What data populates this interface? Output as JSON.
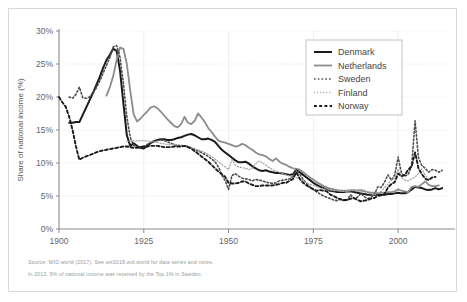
{
  "figure": {
    "notes": [
      "Source: WID.world (2017). See wir2018.wid.world for data series and notes.",
      "In 2013, 9% of national income was received by the Top 1% in Sweden."
    ]
  },
  "chart_data": {
    "type": "line",
    "title": "",
    "xlabel": "",
    "ylabel": "Share of national income (%)",
    "xlim": [
      1900,
      2015
    ],
    "ylim": [
      0,
      30
    ],
    "xticks": [
      1900,
      1925,
      1950,
      1975,
      2000
    ],
    "xtick_labels": [
      "1900",
      "1925",
      "1950",
      "1975",
      "2000"
    ],
    "yticks": [
      0,
      5,
      10,
      15,
      20,
      25,
      30
    ],
    "ytick_labels": [
      "0%",
      "5%",
      "10%",
      "15%",
      "20%",
      "25%",
      "30%"
    ],
    "grid": "horizontal-dotted-and-vertical-solid",
    "legend_position": "top-right",
    "series": [
      {
        "name": "Denmark",
        "color": "#1a1a1a",
        "style": "solid",
        "width": 2.0,
        "x": [
          1903,
          1904,
          1905,
          1906,
          1907,
          1908,
          1909,
          1910,
          1911,
          1912,
          1913,
          1914,
          1915,
          1916,
          1917,
          1918,
          1919,
          1920,
          1921,
          1922,
          1923,
          1924,
          1925,
          1926,
          1927,
          1928,
          1929,
          1930,
          1931,
          1932,
          1933,
          1934,
          1935,
          1936,
          1937,
          1938,
          1939,
          1940,
          1941,
          1942,
          1943,
          1944,
          1945,
          1946,
          1947,
          1948,
          1949,
          1950,
          1951,
          1952,
          1953,
          1954,
          1955,
          1956,
          1957,
          1958,
          1959,
          1960,
          1961,
          1962,
          1963,
          1964,
          1965,
          1966,
          1967,
          1968,
          1969,
          1970,
          1971,
          1972,
          1973,
          1974,
          1975,
          1976,
          1977,
          1978,
          1979,
          1980,
          1981,
          1982,
          1983,
          1984,
          1985,
          1986,
          1987,
          1988,
          1989,
          1990,
          1991,
          1992,
          1993,
          1994,
          1995,
          1996,
          1997,
          1998,
          1999,
          2000,
          2001,
          2002,
          2003,
          2004,
          2005,
          2006,
          2007,
          2008,
          2009,
          2010,
          2011,
          2012,
          2013
        ],
        "y": [
          16.1,
          16.1,
          16.2,
          16.2,
          17.3,
          18.4,
          19.5,
          20.6,
          21.8,
          23.0,
          24.4,
          25.6,
          26.4,
          27.3,
          27.0,
          24.0,
          19.0,
          14.2,
          12.6,
          13.0,
          12.6,
          12.3,
          12.2,
          12.6,
          13.0,
          13.3,
          13.5,
          13.6,
          13.6,
          13.5,
          13.5,
          13.6,
          13.8,
          13.9,
          14.1,
          14.3,
          14.4,
          14.2,
          13.9,
          13.6,
          13.6,
          13.7,
          13.5,
          13.2,
          12.6,
          12.0,
          11.6,
          11.2,
          10.8,
          10.4,
          10.1,
          10.1,
          10.2,
          9.9,
          9.5,
          9.2,
          8.9,
          8.8,
          8.9,
          8.7,
          8.6,
          8.5,
          8.5,
          8.4,
          8.3,
          8.2,
          8.3,
          9.0,
          8.6,
          8.2,
          7.8,
          7.4,
          7.0,
          6.7,
          6.4,
          6.2,
          6.0,
          5.8,
          5.7,
          5.6,
          5.6,
          5.6,
          5.7,
          5.7,
          5.6,
          5.5,
          5.4,
          5.3,
          5.2,
          5.2,
          5.2,
          5.2,
          5.2,
          5.2,
          5.3,
          5.3,
          5.4,
          5.5,
          5.4,
          5.4,
          5.6,
          6.0,
          6.4,
          6.3,
          6.2,
          6.0,
          5.9,
          6.0,
          6.2,
          6.0,
          6.2
        ]
      },
      {
        "name": "Netherlands",
        "color": "#8c8c8c",
        "style": "solid",
        "width": 1.8,
        "x": [
          1914,
          1915,
          1916,
          1917,
          1918,
          1919,
          1920,
          1921,
          1922,
          1923,
          1924,
          1925,
          1926,
          1927,
          1928,
          1929,
          1930,
          1931,
          1932,
          1933,
          1934,
          1935,
          1936,
          1937,
          1938,
          1939,
          1940,
          1941,
          1942,
          1943,
          1944,
          1945,
          1946,
          1947,
          1948,
          1949,
          1950,
          1951,
          1952,
          1953,
          1954,
          1955,
          1956,
          1957,
          1958,
          1959,
          1960,
          1961,
          1962,
          1963,
          1964,
          1965,
          1966,
          1967,
          1968,
          1969,
          1970,
          1971,
          1972,
          1973,
          1974,
          1975,
          1976,
          1977,
          1978,
          1979,
          1980,
          1981,
          1982,
          1983,
          1984,
          1985,
          1986,
          1987,
          1988,
          1989,
          1990,
          1991,
          1992,
          1993,
          1994,
          1995,
          1996,
          1997,
          1998,
          1999,
          2000,
          2001,
          2002,
          2003,
          2004,
          2005,
          2006,
          2007,
          2008,
          2009,
          2010,
          2011,
          2012
        ],
        "y": [
          20.2,
          21.5,
          23.2,
          25.6,
          27.5,
          27.3,
          25.0,
          21.0,
          17.4,
          16.3,
          16.7,
          17.3,
          17.8,
          18.4,
          18.6,
          18.3,
          17.8,
          17.2,
          16.6,
          16.1,
          15.6,
          15.4,
          15.9,
          17.0,
          16.1,
          15.9,
          16.4,
          17.5,
          16.9,
          16.2,
          15.3,
          14.7,
          14.0,
          13.4,
          13.2,
          13.1,
          12.9,
          12.7,
          12.5,
          12.6,
          12.9,
          12.7,
          12.3,
          12.0,
          11.6,
          11.3,
          11.2,
          11.0,
          10.6,
          10.3,
          10.7,
          10.2,
          9.9,
          9.7,
          9.4,
          9.2,
          9.1,
          9.0,
          8.6,
          8.2,
          7.8,
          7.5,
          7.1,
          6.8,
          6.5,
          6.3,
          6.1,
          6.0,
          5.9,
          5.8,
          5.8,
          5.8,
          5.9,
          5.9,
          5.8,
          5.8,
          5.7,
          5.6,
          5.5,
          5.5,
          5.4,
          5.5,
          5.5,
          5.6,
          5.6,
          5.7,
          6.0,
          5.8,
          5.7,
          5.6,
          6.4,
          6.5,
          6.4,
          6.8,
          7.2,
          6.7,
          6.5,
          6.5,
          6.6
        ]
      },
      {
        "name": "Sweden",
        "color": "#4d4d4d",
        "style": "dotted-medium",
        "width": 1.6,
        "x": [
          1903,
          1904,
          1905,
          1906,
          1907,
          1908,
          1909,
          1910,
          1911,
          1912,
          1913,
          1914,
          1915,
          1916,
          1917,
          1918,
          1919,
          1920,
          1921,
          1922,
          1923,
          1924,
          1925,
          1926,
          1927,
          1928,
          1929,
          1930,
          1931,
          1932,
          1933,
          1934,
          1935,
          1936,
          1937,
          1938,
          1939,
          1940,
          1941,
          1942,
          1943,
          1944,
          1945,
          1946,
          1947,
          1948,
          1949,
          1950,
          1951,
          1952,
          1953,
          1954,
          1955,
          1956,
          1957,
          1958,
          1959,
          1960,
          1961,
          1962,
          1963,
          1964,
          1965,
          1966,
          1967,
          1968,
          1969,
          1970,
          1971,
          1972,
          1973,
          1974,
          1975,
          1976,
          1977,
          1978,
          1979,
          1980,
          1981,
          1982,
          1983,
          1984,
          1985,
          1986,
          1987,
          1988,
          1989,
          1990,
          1991,
          1992,
          1993,
          1994,
          1995,
          1996,
          1997,
          1998,
          1999,
          2000,
          2001,
          2002,
          2003,
          2004,
          2005,
          2006,
          2007,
          2008,
          2009,
          2010,
          2011,
          2012,
          2013
        ],
        "y": [
          20.0,
          19.8,
          20.4,
          21.5,
          19.9,
          19.8,
          20.0,
          20.6,
          21.4,
          22.4,
          23.6,
          24.8,
          26.0,
          27.6,
          27.8,
          26.0,
          22.0,
          17.0,
          13.9,
          12.7,
          12.4,
          12.3,
          12.5,
          12.8,
          13.1,
          13.3,
          13.4,
          13.5,
          13.4,
          13.2,
          13.0,
          12.8,
          12.6,
          12.5,
          12.6,
          12.5,
          12.3,
          12.1,
          11.8,
          11.6,
          11.3,
          11.0,
          10.6,
          10.2,
          9.4,
          8.2,
          7.3,
          6.0,
          8.1,
          8.4,
          8.0,
          7.7,
          7.6,
          7.5,
          7.3,
          7.5,
          7.4,
          7.3,
          7.1,
          7.0,
          6.9,
          7.0,
          7.3,
          7.4,
          7.5,
          7.6,
          8.0,
          9.0,
          8.3,
          7.5,
          6.9,
          6.4,
          6.0,
          5.6,
          5.3,
          5.0,
          4.8,
          4.6,
          4.4,
          4.3,
          4.5,
          4.3,
          4.4,
          5.2,
          4.6,
          4.8,
          5.4,
          4.9,
          4.6,
          4.8,
          5.2,
          6.4,
          6.3,
          7.1,
          8.2,
          7.4,
          8.2,
          10.9,
          8.4,
          8.0,
          8.3,
          9.6,
          16.4,
          10.8,
          9.6,
          9.2,
          8.6,
          9.0,
          8.9,
          8.6,
          8.9
        ]
      },
      {
        "name": "Finland",
        "color": "#a6a6a6",
        "style": "dotted-fine",
        "width": 1.3,
        "x": [
          1920,
          1921,
          1922,
          1923,
          1924,
          1925,
          1926,
          1927,
          1928,
          1929,
          1930,
          1931,
          1932,
          1933,
          1934,
          1935,
          1936,
          1937,
          1938,
          1939,
          1940,
          1941,
          1942,
          1943,
          1944,
          1945,
          1946,
          1947,
          1948,
          1949,
          1950,
          1951,
          1952,
          1953,
          1954,
          1955,
          1956,
          1957,
          1958,
          1959,
          1960,
          1961,
          1962,
          1963,
          1964,
          1965,
          1966,
          1967,
          1968,
          1969,
          1970,
          1971,
          1972,
          1973,
          1974,
          1975,
          1976,
          1977,
          1978,
          1979,
          1980,
          1981,
          1982,
          1983,
          1984,
          1985,
          1986,
          1987,
          1988,
          1989,
          1990,
          1991,
          1992,
          1993,
          1994,
          1995,
          1996,
          1997,
          1998,
          1999,
          2000,
          2001,
          2002,
          2003,
          2004,
          2005,
          2006,
          2007,
          2008,
          2009
        ],
        "y": [
          13.3,
          13.3,
          13.4,
          13.3,
          13.4,
          13.4,
          13.3,
          13.3,
          13.2,
          13.1,
          13.0,
          12.9,
          12.8,
          12.8,
          12.8,
          12.8,
          12.7,
          12.6,
          12.5,
          12.3,
          12.1,
          12.0,
          11.8,
          11.6,
          11.3,
          11.0,
          10.6,
          10.2,
          9.8,
          9.4,
          9.0,
          10.5,
          9.7,
          9.4,
          9.3,
          9.2,
          9.0,
          9.2,
          9.9,
          10.3,
          10.0,
          9.7,
          9.3,
          9.0,
          8.8,
          8.6,
          8.4,
          8.2,
          8.0,
          7.9,
          7.8,
          7.6,
          7.3,
          7.0,
          6.8,
          6.6,
          6.4,
          6.2,
          6.1,
          6.0,
          5.9,
          5.8,
          5.8,
          5.7,
          5.7,
          5.7,
          5.8,
          5.8,
          5.9,
          6.0,
          5.9,
          5.6,
          5.3,
          5.2,
          5.5,
          5.7,
          6.3,
          6.8,
          7.4,
          7.7,
          9.1,
          7.8,
          7.4,
          7.3,
          7.6,
          7.9,
          8.4,
          9.1,
          8.1,
          7.5
        ]
      },
      {
        "name": "Norway",
        "color": "#1a1a1a",
        "style": "dashed-thick",
        "width": 1.9,
        "x": [
          1900,
          1901,
          1902,
          1903,
          1904,
          1905,
          1906,
          1907,
          1908,
          1909,
          1910,
          1911,
          1912,
          1913,
          1914,
          1915,
          1916,
          1917,
          1918,
          1919,
          1920,
          1921,
          1922,
          1923,
          1924,
          1925,
          1926,
          1927,
          1928,
          1929,
          1930,
          1931,
          1932,
          1933,
          1934,
          1935,
          1936,
          1937,
          1938,
          1939,
          1940,
          1941,
          1942,
          1943,
          1944,
          1945,
          1946,
          1947,
          1948,
          1949,
          1950,
          1951,
          1952,
          1953,
          1954,
          1955,
          1956,
          1957,
          1958,
          1959,
          1960,
          1961,
          1962,
          1963,
          1964,
          1965,
          1966,
          1967,
          1968,
          1969,
          1970,
          1971,
          1972,
          1973,
          1974,
          1975,
          1976,
          1977,
          1978,
          1979,
          1980,
          1981,
          1982,
          1983,
          1984,
          1985,
          1986,
          1987,
          1988,
          1989,
          1990,
          1991,
          1992,
          1993,
          1994,
          1995,
          1996,
          1997,
          1998,
          1999,
          2000,
          2001,
          2002,
          2003,
          2004,
          2005,
          2006,
          2007,
          2008,
          2009,
          2010,
          2011
        ],
        "y": [
          20.0,
          19.2,
          18.5,
          17.0,
          15.0,
          12.5,
          10.5,
          10.8,
          11.0,
          11.2,
          11.4,
          11.6,
          11.8,
          11.9,
          12.0,
          12.1,
          12.2,
          12.3,
          12.4,
          12.5,
          12.5,
          12.4,
          12.3,
          12.3,
          12.4,
          12.5,
          12.5,
          12.6,
          12.6,
          12.6,
          12.5,
          12.4,
          12.4,
          12.4,
          12.5,
          12.5,
          12.5,
          12.6,
          12.4,
          12.2,
          11.8,
          11.4,
          11.0,
          10.6,
          10.2,
          9.7,
          9.2,
          8.7,
          8.3,
          7.9,
          7.0,
          6.9,
          6.9,
          7.0,
          7.2,
          7.2,
          6.9,
          6.7,
          6.5,
          6.5,
          6.6,
          6.6,
          6.6,
          6.6,
          6.7,
          6.8,
          7.0,
          7.0,
          7.3,
          7.6,
          8.6,
          7.6,
          7.0,
          6.6,
          6.3,
          6.0,
          5.8,
          5.9,
          5.8,
          5.7,
          5.2,
          5.0,
          4.7,
          4.5,
          4.4,
          4.4,
          4.6,
          4.7,
          4.4,
          4.2,
          4.3,
          4.4,
          4.6,
          4.7,
          5.0,
          5.1,
          5.3,
          6.3,
          6.8,
          7.1,
          8.4,
          8.0,
          8.2,
          9.0,
          9.5,
          11.6,
          9.2,
          8.3,
          7.6,
          7.4,
          7.8,
          7.9
        ]
      }
    ]
  }
}
